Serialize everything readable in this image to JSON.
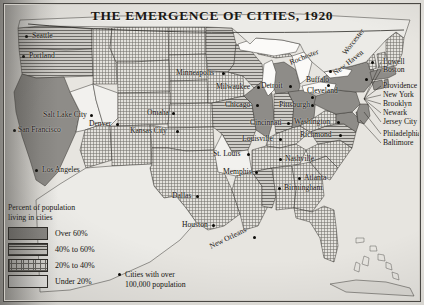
{
  "map": {
    "title": "THE EMERGENCE OF CITIES, 1920",
    "subject": "United States urbanization by state, 1920 census",
    "projection_note": "Contiguous United States with Great Lakes, Florida, Bahamas and Cuba"
  },
  "legend": {
    "heading_line1": "Percent of population",
    "heading_line2": "living in cities",
    "classes": [
      {
        "label": "Over 60%",
        "pattern": "solid-gray",
        "color": "#8e8c88"
      },
      {
        "label": "40% to 60%",
        "pattern": "horizontal-lines",
        "color": "#cfcdc8"
      },
      {
        "label": "20% to 40%",
        "pattern": "fine-crosshatch",
        "color": "#e3e1dc"
      },
      {
        "label": "Under 20%",
        "pattern": "blank-white",
        "color": "#f2f1ee"
      }
    ],
    "city_key_line1": "Cities with over",
    "city_key_line2": "100,000 population"
  },
  "cities": [
    {
      "name": "Seattle",
      "x": 26,
      "y": 36,
      "dx": 6,
      "dy": -4,
      "rot": 0
    },
    {
      "name": "Portland",
      "x": 23,
      "y": 56,
      "dx": 6,
      "dy": -4,
      "rot": 0
    },
    {
      "name": "Salt Lake City",
      "x": 91,
      "y": 115,
      "dx": -48,
      "dy": -4,
      "rot": 0
    },
    {
      "name": "San Francisco",
      "x": 14,
      "y": 130,
      "dx": 4,
      "dy": -4,
      "rot": 0
    },
    {
      "name": "Los Angeles",
      "x": 36,
      "y": 170,
      "dx": 6,
      "dy": -4,
      "rot": 0
    },
    {
      "name": "Denver",
      "x": 117,
      "y": 124,
      "dx": -28,
      "dy": -4,
      "rot": 0
    },
    {
      "name": "Minneapolis",
      "x": 223,
      "y": 73,
      "dx": -47,
      "dy": -4,
      "rot": 0
    },
    {
      "name": "Milwaukee",
      "x": 258,
      "y": 87,
      "dx": -42,
      "dy": -4,
      "rot": 0
    },
    {
      "name": "Omaha",
      "x": 173,
      "y": 113,
      "dx": -26,
      "dy": -4,
      "rot": 0
    },
    {
      "name": "Kansas City",
      "x": 177,
      "y": 131,
      "dx": -47,
      "dy": -4,
      "rot": 0
    },
    {
      "name": "Chicago",
      "x": 257,
      "y": 105,
      "dx": -32,
      "dy": -4,
      "rot": 0
    },
    {
      "name": "Detroit",
      "x": 290,
      "y": 86,
      "dx": -29,
      "dy": -4,
      "rot": 0
    },
    {
      "name": "Cincinnati",
      "x": 288,
      "y": 123,
      "dx": -38,
      "dy": -4,
      "rot": 0
    },
    {
      "name": "Louisville",
      "x": 280,
      "y": 139,
      "dx": -38,
      "dy": -4,
      "rot": 0
    },
    {
      "name": "St. Louis",
      "x": 248,
      "y": 154,
      "dx": -35,
      "dy": -4,
      "rot": 0
    },
    {
      "name": "Nashville",
      "x": 280,
      "y": 159,
      "dx": 5,
      "dy": -4,
      "rot": 0
    },
    {
      "name": "Memphis",
      "x": 256,
      "y": 172,
      "dx": -33,
      "dy": -4,
      "rot": 0
    },
    {
      "name": "Birmingham",
      "x": 279,
      "y": 188,
      "dx": 5,
      "dy": -4,
      "rot": 0
    },
    {
      "name": "Atlanta",
      "x": 299,
      "y": 178,
      "dx": 5,
      "dy": -4,
      "rot": 0
    },
    {
      "name": "Dallas",
      "x": 197,
      "y": 196,
      "dx": -25,
      "dy": -4,
      "rot": 0
    },
    {
      "name": "Houston",
      "x": 213,
      "y": 225,
      "dx": -31,
      "dy": -4,
      "rot": 0
    },
    {
      "name": "New Orleans",
      "x": 254,
      "y": 237,
      "dx": -44,
      "dy": 6,
      "rot": -26
    },
    {
      "name": "Pittsburgh",
      "x": 312,
      "y": 105,
      "dx": -33,
      "dy": -4,
      "rot": 0
    },
    {
      "name": "Cleveland",
      "x": 312,
      "y": 97,
      "dx": -5,
      "dy": -10,
      "rot": 0
    },
    {
      "name": "Washington",
      "x": 338,
      "y": 122,
      "dx": -44,
      "dy": -4,
      "rot": 0
    },
    {
      "name": "Richmond",
      "x": 340,
      "y": 135,
      "dx": -40,
      "dy": -4,
      "rot": 0
    },
    {
      "name": "Buffalo",
      "x": 328,
      "y": 85,
      "dx": -22,
      "dy": -9,
      "rot": 0
    },
    {
      "name": "Rochester",
      "x": 330,
      "y": 71,
      "dx": -40,
      "dy": -12,
      "rot": -22
    },
    {
      "name": "Worcester",
      "x": 372,
      "y": 62,
      "dx": -28,
      "dy": -12,
      "rot": -52
    },
    {
      "name": "New Haven",
      "x": 366,
      "y": 79,
      "dx": -32,
      "dy": -9,
      "rot": -38
    }
  ],
  "east_coast_stack": [
    {
      "name": "Lowell",
      "x": 383,
      "y": 62
    },
    {
      "name": "Boston",
      "x": 383,
      "y": 70
    },
    {
      "name": "Providence",
      "x": 383,
      "y": 86
    },
    {
      "name": "New York",
      "x": 383,
      "y": 95
    },
    {
      "name": "Brooklyn",
      "x": 383,
      "y": 104
    },
    {
      "name": "Newark",
      "x": 383,
      "y": 113
    },
    {
      "name": "Jersey City",
      "x": 383,
      "y": 122
    },
    {
      "name": "Philadelphia",
      "x": 383,
      "y": 134
    },
    {
      "name": "Baltimore",
      "x": 383,
      "y": 143
    }
  ]
}
